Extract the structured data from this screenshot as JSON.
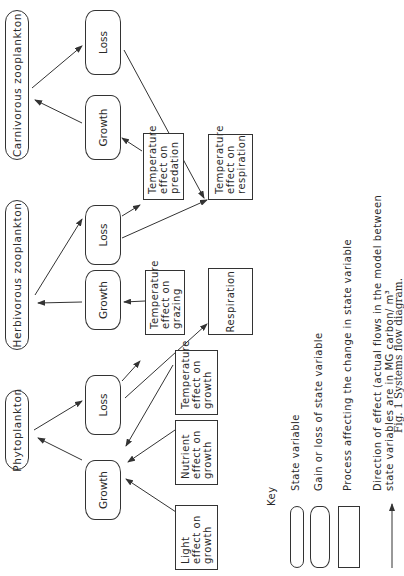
{
  "diagram": {
    "state_variables": {
      "carnivorous": "Carnivorous  zooplankton",
      "herbivorous": "Herbivorous  zooplankton",
      "phytoplankton": "Phytoplankton"
    },
    "flux_boxes": {
      "carn_loss": "Loss",
      "carn_growth": "Growth",
      "herb_loss": "Loss",
      "herb_growth": "Growth",
      "phyto_loss": "Loss",
      "phyto_growth": "Growth"
    },
    "processes": {
      "temp_predation": [
        "Temperature",
        "effect on",
        "predation"
      ],
      "temp_respiration": [
        "Temperature",
        "effect on",
        "respiration"
      ],
      "temp_grazing": [
        "Temperature",
        "effect on",
        "grazing"
      ],
      "respiration": "Respiration",
      "temp_growth": [
        "Temperature",
        "effect on",
        "growth"
      ],
      "nutrient_growth": [
        "Nutrient",
        "effect on",
        "growth"
      ],
      "light_growth": [
        "Light",
        "effect on",
        "growth"
      ]
    }
  },
  "key": {
    "title": "Key",
    "state_variable": "State variable",
    "gain_loss": "Gain or loss of state variable",
    "process": "Process affecting the change in state variable",
    "direction_line1": "Direction of effect (actual flows in the model between",
    "direction_line2": "state variables are in MG carbon/ m³"
  },
  "caption": "Fig. 1   Systems flow diagram."
}
